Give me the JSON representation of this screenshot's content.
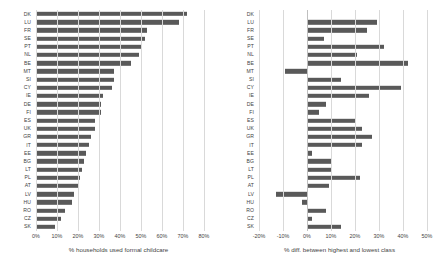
{
  "chart_data": [
    {
      "type": "bar",
      "orientation": "horizontal",
      "title": "",
      "xlabel": "% households used formal childcare",
      "ylabel": "",
      "xlim": [
        0,
        80
      ],
      "xticks": [
        0,
        10,
        20,
        30,
        40,
        50,
        60,
        70,
        80
      ],
      "xtick_labels": [
        "0%",
        "10%",
        "20%",
        "30%",
        "40%",
        "50%",
        "60%",
        "70%",
        "80%"
      ],
      "grid": true,
      "legend": "none",
      "bar_color": "#595959",
      "categories": [
        "DK",
        "LU",
        "FR",
        "SE",
        "PT",
        "NL",
        "BE",
        "MT",
        "SI",
        "CY",
        "IE",
        "DE",
        "FI",
        "ES",
        "UK",
        "GR",
        "IT",
        "EE",
        "BG",
        "LT",
        "PL",
        "AT",
        "LV",
        "HU",
        "RO",
        "CZ",
        "SK"
      ],
      "values": [
        72,
        68,
        53,
        52,
        50,
        49,
        45,
        37,
        37,
        36,
        32,
        31,
        31,
        28,
        28,
        26,
        25,
        24,
        23,
        22,
        21,
        20,
        18,
        17,
        14,
        12,
        9
      ]
    },
    {
      "type": "bar",
      "orientation": "horizontal",
      "title": "",
      "xlabel": "% diff. between highest and lowest class",
      "ylabel": "",
      "xlim": [
        -20,
        50
      ],
      "xticks": [
        -20,
        -10,
        0,
        10,
        20,
        30,
        40,
        50
      ],
      "xtick_labels": [
        "-20%",
        "-10%",
        "0%",
        "10%",
        "20%",
        "30%",
        "40%",
        "50%"
      ],
      "grid": true,
      "legend": "none",
      "bar_color": "#595959",
      "categories": [
        "DK",
        "LU",
        "FR",
        "SE",
        "PT",
        "NL",
        "BE",
        "MT",
        "SI",
        "CY",
        "IE",
        "DE",
        "FI",
        "ES",
        "UK",
        "GR",
        "IT",
        "EE",
        "BG",
        "LT",
        "PL",
        "AT",
        "LV",
        "HU",
        "RO",
        "CZ",
        "SK"
      ],
      "values": [
        0.5,
        29,
        25,
        7,
        32,
        21,
        42,
        -9,
        14,
        39,
        26,
        8,
        5,
        20,
        23,
        27,
        23,
        2,
        10,
        10,
        22,
        9,
        -13,
        -2,
        8,
        2,
        14
      ]
    }
  ],
  "panels": {
    "left": {
      "name": "formal-childcare-usage-chart",
      "axis_title": "% households used formal childcare"
    },
    "right": {
      "name": "class-difference-chart",
      "axis_title": "% diff. between highest and lowest class"
    }
  }
}
